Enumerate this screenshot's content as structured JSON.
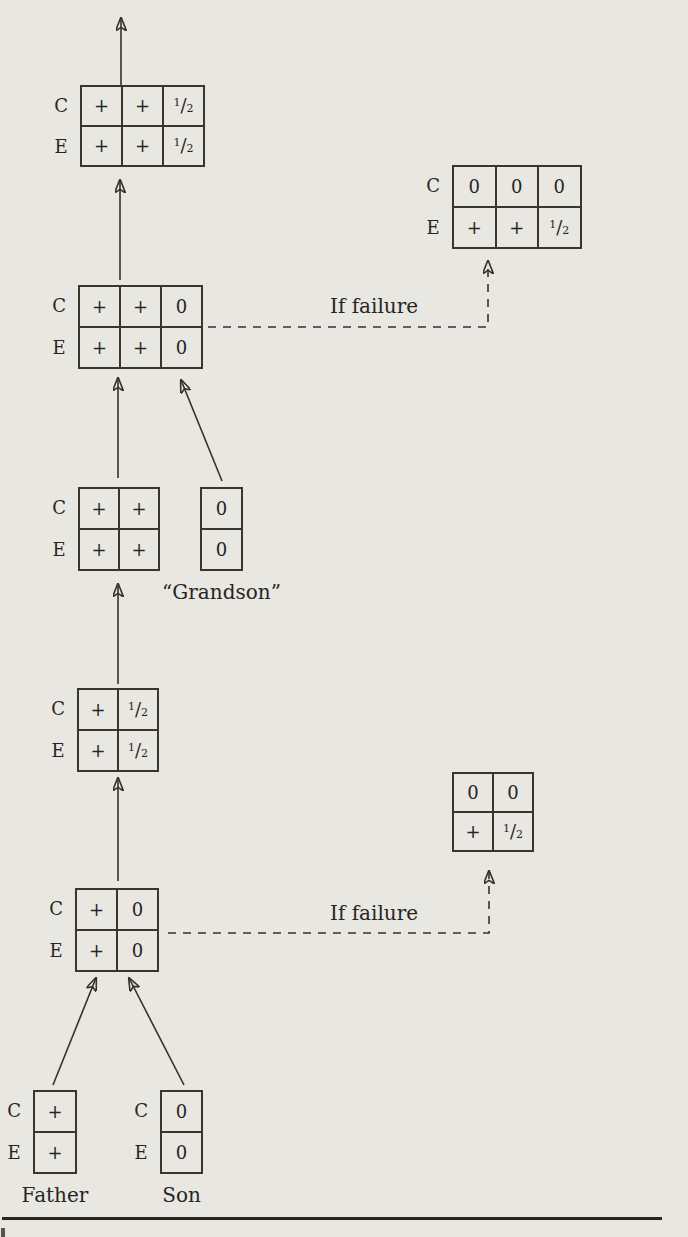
{
  "diagram": {
    "row_labels": [
      "C",
      "E"
    ],
    "if_failure_label": "If failure",
    "tables": {
      "final": {
        "cells": [
          [
            "+",
            "+",
            "½"
          ],
          [
            "+",
            "+",
            "½"
          ]
        ]
      },
      "final_failure": {
        "cells": [
          [
            "0",
            "0",
            "0"
          ],
          [
            "+",
            "+",
            "½"
          ]
        ]
      },
      "with_grandson": {
        "cells": [
          [
            "+",
            "+",
            "0"
          ],
          [
            "+",
            "+",
            "0"
          ]
        ]
      },
      "parents_pair": {
        "cells": [
          [
            "+",
            "+"
          ],
          [
            "+",
            "+"
          ]
        ]
      },
      "grandson": {
        "cells": [
          [
            "0"
          ],
          [
            "0"
          ]
        ],
        "caption": "“Grandson”"
      },
      "son_grown": {
        "cells": [
          [
            "+",
            "½"
          ],
          [
            "+",
            "½"
          ]
        ]
      },
      "son_failure": {
        "cells": [
          [
            "0",
            "0"
          ],
          [
            "+",
            "½"
          ]
        ]
      },
      "with_son": {
        "cells": [
          [
            "+",
            "0"
          ],
          [
            "+",
            "0"
          ]
        ]
      },
      "father": {
        "cells": [
          [
            "+"
          ],
          [
            "+"
          ]
        ],
        "caption": "Father"
      },
      "son": {
        "cells": [
          [
            "0"
          ],
          [
            "0"
          ]
        ],
        "caption": "Son"
      }
    }
  }
}
